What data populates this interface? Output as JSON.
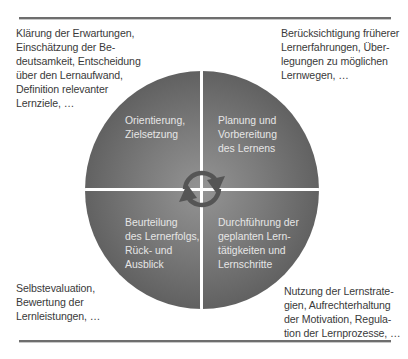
{
  "diagram": {
    "type": "cycle",
    "colors": {
      "circle_center": "#949494",
      "circle_edge": "#4e4e4e",
      "quadrant_text": "#e6e6e6",
      "note_text": "#3a3a3a",
      "rule": "#6e6e6e",
      "cycle_arrow": "#555555"
    },
    "center_icon": "circular-arrows-icon",
    "quadrants": {
      "top_left": {
        "lines": [
          "Orientierung,",
          "Zielsetzung"
        ]
      },
      "top_right": {
        "lines": [
          "Planung und",
          "Vorbereitung",
          "des Lernens"
        ]
      },
      "bottom_right": {
        "lines": [
          "Durchführung der",
          "geplanten Lern-",
          "tätigkeiten und",
          "Lernschritte"
        ]
      },
      "bottom_left": {
        "lines": [
          "Beurteilung",
          "des Lernerfolgs,",
          "Rück- und",
          "Ausblick"
        ]
      }
    },
    "notes": {
      "top_left": {
        "lines": [
          "Klärung der Erwartungen,",
          "Einschätzung der Be-",
          "deutsamkeit, Entscheidung",
          "über den Lernaufwand,",
          "Definition relevanter",
          "Lernziele, …"
        ]
      },
      "top_right": {
        "lines": [
          "Berücksichtigung früherer",
          "Lernerfahrungen, Über-",
          "legungen zu möglichen",
          "Lernwegen, …"
        ]
      },
      "bottom_left": {
        "lines": [
          "Selbstevaluation,",
          "Bewertung der",
          "Lernleistungen, …"
        ]
      },
      "bottom_right": {
        "lines": [
          "Nutzung der Lernstrate-",
          "gien, Aufrechterhaltung",
          "der Motivation, Regula-",
          "tion der Lernprozesse, …"
        ]
      }
    }
  }
}
